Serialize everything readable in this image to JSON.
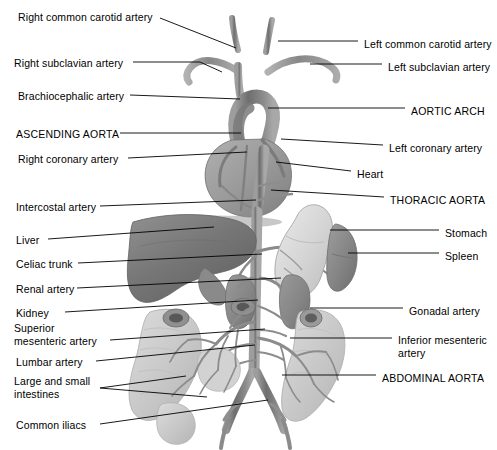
{
  "figure": {
    "type": "anatomical-illustration",
    "palette": {
      "background": "#ffffff",
      "leader_line": "#000000",
      "vessel_dark": "#6f6f6f",
      "vessel_mid": "#8d8d8d",
      "vessel_light": "#a9a9a9",
      "liver": "#7d7d7d",
      "heart": "#9a9a9a",
      "stomach": "#d6d6d6",
      "spleen": "#8a8a8a",
      "kidney": "#868686",
      "intestine": "#c9c9c9",
      "text": "#000000"
    }
  },
  "labels": {
    "left": [
      {
        "id": "right-common-carotid-artery",
        "text": "Right common carotid artery",
        "x": 18,
        "y": 11,
        "style": "normal"
      },
      {
        "id": "right-subclavian-artery",
        "text": "Right subclavian artery",
        "x": 14,
        "y": 57,
        "style": "normal"
      },
      {
        "id": "brachiocephalic-artery",
        "text": "Brachiocephalic artery",
        "x": 18,
        "y": 90,
        "style": "normal"
      },
      {
        "id": "ascending-aorta",
        "text": "ASCENDING AORTA",
        "x": 16,
        "y": 128,
        "style": "caps"
      },
      {
        "id": "right-coronary-artery",
        "text": "Right coronary artery",
        "x": 18,
        "y": 153,
        "style": "normal"
      },
      {
        "id": "intercostal-artery",
        "text": "Intercostal artery",
        "x": 16,
        "y": 201,
        "style": "normal"
      },
      {
        "id": "liver",
        "text": "Liver",
        "x": 16,
        "y": 234,
        "style": "normal"
      },
      {
        "id": "celiac-trunk",
        "text": "Celiac trunk",
        "x": 16,
        "y": 258,
        "style": "normal"
      },
      {
        "id": "renal-artery",
        "text": "Renal artery",
        "x": 16,
        "y": 283,
        "style": "normal"
      },
      {
        "id": "kidney",
        "text": "Kidney",
        "x": 16,
        "y": 307,
        "style": "normal"
      },
      {
        "id": "superior-mesenteric-artery",
        "text": "Superior\nmesenteric artery",
        "x": 14,
        "y": 322,
        "style": "normal"
      },
      {
        "id": "lumbar-artery",
        "text": "Lumbar artery",
        "x": 16,
        "y": 356,
        "style": "normal"
      },
      {
        "id": "large-and-small-intestines",
        "text": "Large and small\nintestines",
        "x": 14,
        "y": 375,
        "style": "normal"
      },
      {
        "id": "common-iliacs",
        "text": "Common iliacs",
        "x": 16,
        "y": 419,
        "style": "normal"
      }
    ],
    "right": [
      {
        "id": "left-common-carotid-artery",
        "text": "Left common carotid artery",
        "x": 364,
        "y": 38,
        "style": "normal"
      },
      {
        "id": "left-subclavian-artery",
        "text": "Left subclavian artery",
        "x": 388,
        "y": 61,
        "style": "normal"
      },
      {
        "id": "aortic-arch",
        "text": "AORTIC ARCH",
        "x": 411,
        "y": 105,
        "style": "caps"
      },
      {
        "id": "left-coronary-artery",
        "text": "Left coronary artery",
        "x": 389,
        "y": 142,
        "style": "normal"
      },
      {
        "id": "heart",
        "text": "Heart",
        "x": 357,
        "y": 168,
        "style": "normal"
      },
      {
        "id": "thoracic-aorta",
        "text": "THORACIC AORTA",
        "x": 390,
        "y": 194,
        "style": "caps"
      },
      {
        "id": "stomach",
        "text": "Stomach",
        "x": 445,
        "y": 227,
        "style": "normal"
      },
      {
        "id": "spleen",
        "text": "Spleen",
        "x": 445,
        "y": 250,
        "style": "normal"
      },
      {
        "id": "gonadal-artery",
        "text": "Gonadal artery",
        "x": 409,
        "y": 305,
        "style": "normal"
      },
      {
        "id": "inferior-mesenteric-artery",
        "text": "Inferior mesenteric\nartery",
        "x": 398,
        "y": 334,
        "style": "normal"
      },
      {
        "id": "abdominal-aorta",
        "text": "ABDOMINAL AORTA",
        "x": 382,
        "y": 372,
        "style": "caps"
      }
    ]
  },
  "leaders": [
    {
      "for": "right-common-carotid-artery",
      "points": "160,18 236,48"
    },
    {
      "for": "right-subclavian-artery",
      "points": "133,62 200,62 222,72"
    },
    {
      "for": "brachiocephalic-artery",
      "points": "130,95 240,99"
    },
    {
      "for": "ascending-aorta",
      "points": "120,133 241,133"
    },
    {
      "for": "right-coronary-artery",
      "points": "128,158 247,152"
    },
    {
      "for": "intercostal-artery",
      "points": "100,206 256,200"
    },
    {
      "for": "liver",
      "points": "48,239 214,227"
    },
    {
      "for": "celiac-trunk",
      "points": "78,263 262,254"
    },
    {
      "for": "renal-artery",
      "points": "77,288 281,278"
    },
    {
      "for": "kidney",
      "points": "65,312 258,300"
    },
    {
      "for": "superior-mesenteric-artery",
      "points": "110,340 265,329"
    },
    {
      "for": "lumbar-artery",
      "points": "96,361 255,345"
    },
    {
      "for": "large-and-small-intestines",
      "points": "100,388 186,376"
    },
    {
      "for": "large-and-small-intestines-2",
      "points": "100,388 207,397"
    },
    {
      "for": "common-iliacs",
      "points": "100,424 268,400"
    },
    {
      "for": "left-common-carotid-artery",
      "points": "358,41 278,41"
    },
    {
      "for": "left-subclavian-artery",
      "points": "382,64 310,64"
    },
    {
      "for": "aortic-arch",
      "points": "405,108 268,108"
    },
    {
      "for": "left-coronary-artery",
      "points": "383,145 281,139"
    },
    {
      "for": "heart",
      "points": "351,171 276,162"
    },
    {
      "for": "thoracic-aorta",
      "points": "384,197 271,190"
    },
    {
      "for": "stomach",
      "points": "439,230 330,230"
    },
    {
      "for": "spleen",
      "points": "439,253 348,253"
    },
    {
      "for": "gonadal-artery",
      "points": "403,308 310,308"
    },
    {
      "for": "inferior-mesenteric-artery",
      "points": "392,338 290,338"
    },
    {
      "for": "abdominal-aorta",
      "points": "376,375 282,375"
    }
  ]
}
